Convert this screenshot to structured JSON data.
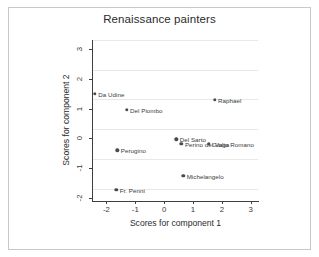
{
  "chart_data": {
    "type": "scatter",
    "title": "Renaissance painters",
    "xlabel": "Scores for component 1",
    "ylabel": "Scores for component 2",
    "xlim": [
      -2.5,
      3.25
    ],
    "ylim": [
      -2.1,
      3.3
    ],
    "xticks": [
      -2,
      -1,
      0,
      1,
      2,
      3
    ],
    "xticklabels": [
      "-2",
      "-1",
      "0",
      "1",
      "2",
      "3"
    ],
    "yticks": [
      -2,
      -1,
      0,
      1,
      2,
      3
    ],
    "yticklabels": [
      "-2",
      "-1",
      "0",
      "1",
      "2",
      "3"
    ],
    "grid": "horizontal",
    "legend": "none",
    "marker_color": "#4a4a4a",
    "points": [
      {
        "label": "Da Udine",
        "x": -2.4,
        "y": 1.5
      },
      {
        "label": "Del Piombo",
        "x": -1.3,
        "y": 0.95
      },
      {
        "label": "Raphael",
        "x": 1.75,
        "y": 1.3
      },
      {
        "label": "Del Sarto",
        "x": 0.42,
        "y": -0.03
      },
      {
        "label": "Perino del Vaga",
        "x": 0.6,
        "y": -0.18
      },
      {
        "label": "Giulio Romano",
        "x": 1.55,
        "y": -0.18
      },
      {
        "label": "Perugino",
        "x": -1.62,
        "y": -0.4
      },
      {
        "label": "Michelangelo",
        "x": 0.66,
        "y": -1.25
      },
      {
        "label": "Fr. Penni",
        "x": -1.66,
        "y": -1.72
      }
    ]
  }
}
